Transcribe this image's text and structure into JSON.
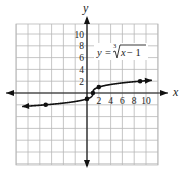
{
  "chart_data": {
    "type": "line",
    "title": "",
    "equation": {
      "lhs": "y",
      "equals": "=",
      "index": "3",
      "radicand_var": "x",
      "radicand_rest": " − 1",
      "text": "y = ∛(x − 1)"
    },
    "xlabel": "x",
    "ylabel": "y",
    "xlim": [
      -12,
      12
    ],
    "ylim": [
      -12,
      12
    ],
    "grid": true,
    "grid_step": 2,
    "x_tick_labels": [
      "2",
      "4",
      "6",
      "8",
      "10"
    ],
    "x_ticks": [
      2,
      4,
      6,
      8,
      10
    ],
    "y_tick_labels": [
      "2",
      "4",
      "6",
      "8",
      "10"
    ],
    "y_ticks": [
      2,
      4,
      6,
      8,
      10
    ],
    "series": [
      {
        "name": "y = cuberoot(x - 1)",
        "function": "cbrt(x-1)",
        "x_range": [
          -11,
          11
        ],
        "arrows": "both"
      }
    ],
    "points": [
      {
        "x": -7,
        "y": -2
      },
      {
        "x": 0,
        "y": -1
      },
      {
        "x": 1,
        "y": 0
      },
      {
        "x": 2,
        "y": 1
      },
      {
        "x": 9,
        "y": 2
      }
    ]
  }
}
